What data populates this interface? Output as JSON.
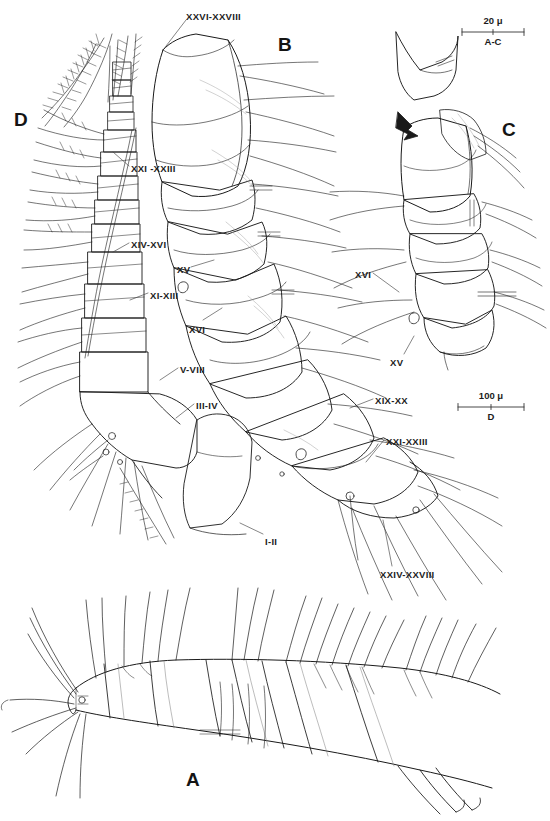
{
  "plate": {
    "background_color": "#ffffff",
    "ink_color": "#1a1a1a",
    "width": 550,
    "height": 821
  },
  "panels": [
    {
      "id": "A",
      "letter": "A",
      "x": 186,
      "y": 770,
      "description": "lateral habitus of segmented body with setae"
    },
    {
      "id": "B",
      "letter": "B",
      "x": 278,
      "y": 35,
      "description": "antennule proximal segments"
    },
    {
      "id": "C",
      "letter": "C",
      "x": 502,
      "y": 120,
      "description": "antennule detail segments XV-XVI"
    },
    {
      "id": "D",
      "letter": "D",
      "x": 14,
      "y": 110,
      "description": "antennule with plumose setae"
    }
  ],
  "labels": [
    {
      "text": "XXVI-XXVIII",
      "x": 186,
      "y": 12,
      "anchor": "start",
      "leader": {
        "x1": 186,
        "y1": 20,
        "x2": 163,
        "y2": 50
      }
    },
    {
      "text": "XXI -XXIII",
      "x": 131,
      "y": 164,
      "anchor": "start",
      "leader": {
        "x1": 129,
        "y1": 166,
        "x2": 113,
        "y2": 152
      }
    },
    {
      "text": "XIV-XVI",
      "x": 131,
      "y": 240,
      "anchor": "start",
      "leader": {
        "x1": 129,
        "y1": 243,
        "x2": 113,
        "y2": 252
      }
    },
    {
      "text": "XV",
      "x": 177,
      "y": 265,
      "anchor": "start",
      "leader": {
        "x1": 191,
        "y1": 267,
        "x2": 214,
        "y2": 260
      }
    },
    {
      "text": "XI-XIII",
      "x": 150,
      "y": 291,
      "anchor": "start",
      "leader": {
        "x1": 148,
        "y1": 293,
        "x2": 130,
        "y2": 300
      }
    },
    {
      "text": "XVI",
      "x": 189,
      "y": 325,
      "anchor": "start",
      "leader": {
        "x1": 203,
        "y1": 320,
        "x2": 222,
        "y2": 308
      }
    },
    {
      "text": "V-VIII",
      "x": 180,
      "y": 365,
      "anchor": "start",
      "leader": {
        "x1": 178,
        "y1": 368,
        "x2": 160,
        "y2": 380
      }
    },
    {
      "text": "III-IV",
      "x": 196,
      "y": 401,
      "anchor": "start",
      "leader": {
        "x1": 194,
        "y1": 404,
        "x2": 176,
        "y2": 418
      }
    },
    {
      "text": "I-II",
      "x": 265,
      "y": 537,
      "anchor": "start",
      "leader": {
        "x1": 263,
        "y1": 534,
        "x2": 240,
        "y2": 523
      }
    },
    {
      "text": "XVI",
      "x": 355,
      "y": 270,
      "anchor": "start",
      "leader": {
        "x1": 373,
        "y1": 273,
        "x2": 399,
        "y2": 292
      }
    },
    {
      "text": "XV",
      "x": 390,
      "y": 358,
      "anchor": "start",
      "leader": {
        "x1": 404,
        "y1": 354,
        "x2": 414,
        "y2": 336
      }
    },
    {
      "text": "XIX-XX",
      "x": 375,
      "y": 396,
      "anchor": "start",
      "leader": {
        "x1": 373,
        "y1": 399,
        "x2": 350,
        "y2": 408
      }
    },
    {
      "text": "XXI-XXIII",
      "x": 386,
      "y": 437,
      "anchor": "start",
      "leader": {
        "x1": 384,
        "y1": 440,
        "x2": 366,
        "y2": 462
      }
    },
    {
      "text": "XXIV-XXVIII",
      "x": 380,
      "y": 570,
      "anchor": "start",
      "leader": {
        "x1": 392,
        "y1": 566,
        "x2": 383,
        "y2": 520
      }
    }
  ],
  "scale_bars": [
    {
      "id": "bar-ac",
      "value": "20 μ",
      "applies_to": "A-C",
      "x": 462,
      "y": 32,
      "length": 62
    },
    {
      "id": "bar-d",
      "value": "100 μ",
      "applies_to": "D",
      "x": 458,
      "y": 407,
      "length": 66
    }
  ],
  "figure": {
    "type": "line-drawing",
    "panel_count": 4
  }
}
